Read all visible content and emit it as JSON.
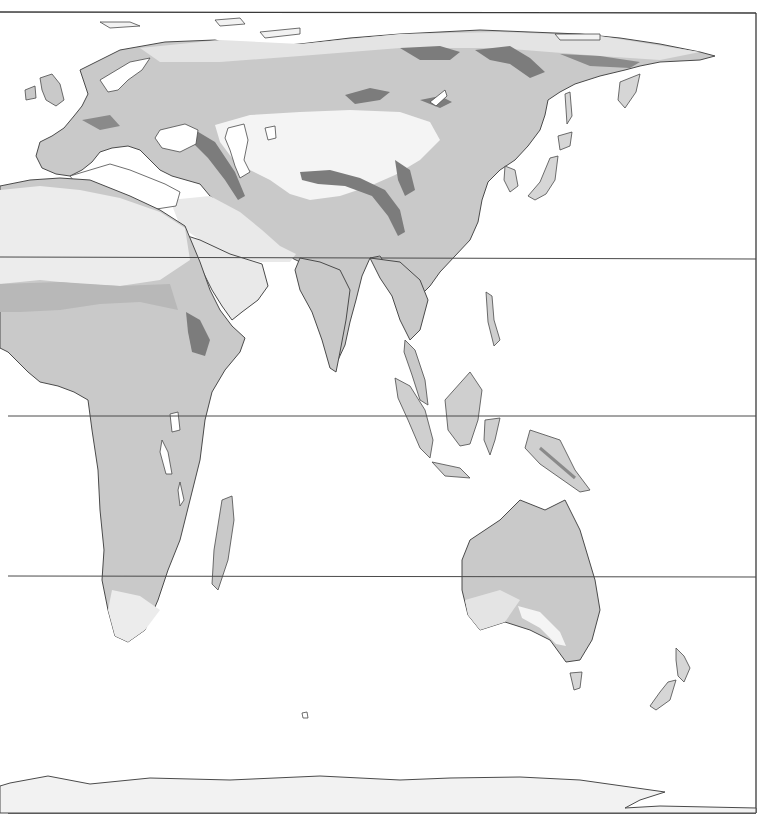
{
  "map": {
    "title": "",
    "projection": "eastern hemisphere, cylindrical",
    "colors": {
      "ocean": "#ffffff",
      "coast": "#4a4a4a",
      "land_light": "#e9e9e9",
      "land_medium": "#c9c9c9",
      "land_mid": "#b4b4b4",
      "land_dark": "#7c7c7c",
      "ice": "#f2f2f2",
      "frame": "#3a3a3a"
    },
    "latitude_lines_y": [
      257,
      416,
      576
    ],
    "frame": {
      "top": 12,
      "right": 756,
      "bottom": 813
    },
    "regions": [
      "Europe",
      "Africa",
      "Asia",
      "Arabian Peninsula",
      "Indian Subcontinent",
      "Southeast Asia",
      "Japan",
      "Australia",
      "New Zealand",
      "Madagascar",
      "Antarctica"
    ]
  }
}
